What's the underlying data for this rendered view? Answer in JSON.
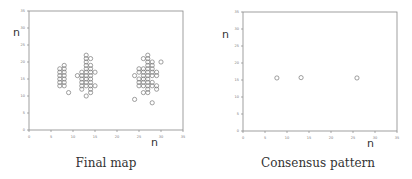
{
  "chart_data": [
    {
      "type": "scatter",
      "title": "Final map",
      "xlabel": "n",
      "ylabel": "n",
      "xlim": [
        0,
        35
      ],
      "ylim": [
        0,
        35
      ],
      "xticks": [
        0,
        5,
        10,
        15,
        20,
        25,
        30,
        35
      ],
      "yticks": [
        0,
        5,
        10,
        15,
        20,
        25,
        30,
        35
      ],
      "grid": false,
      "marker": "open-circle",
      "points": [
        [
          7,
          13
        ],
        [
          7,
          14
        ],
        [
          7,
          15
        ],
        [
          7,
          16
        ],
        [
          7,
          17
        ],
        [
          7,
          18
        ],
        [
          8,
          13
        ],
        [
          8,
          14
        ],
        [
          8,
          15
        ],
        [
          8,
          16
        ],
        [
          8,
          17
        ],
        [
          8,
          18
        ],
        [
          8,
          19
        ],
        [
          9,
          11
        ],
        [
          11,
          16
        ],
        [
          12,
          12
        ],
        [
          12,
          13
        ],
        [
          12,
          14
        ],
        [
          12,
          15
        ],
        [
          12,
          16
        ],
        [
          12,
          17
        ],
        [
          13,
          10
        ],
        [
          13,
          13
        ],
        [
          13,
          14
        ],
        [
          13,
          15
        ],
        [
          13,
          16
        ],
        [
          13,
          17
        ],
        [
          13,
          18
        ],
        [
          13,
          19
        ],
        [
          13,
          20
        ],
        [
          13,
          21
        ],
        [
          13,
          22
        ],
        [
          14,
          11
        ],
        [
          14,
          12
        ],
        [
          14,
          13
        ],
        [
          14,
          14
        ],
        [
          14,
          15
        ],
        [
          14,
          16
        ],
        [
          14,
          17
        ],
        [
          14,
          18
        ],
        [
          14,
          19
        ],
        [
          14,
          21
        ],
        [
          15,
          13
        ],
        [
          15,
          17
        ],
        [
          24,
          9
        ],
        [
          24,
          16
        ],
        [
          25,
          13
        ],
        [
          25,
          14
        ],
        [
          25,
          15
        ],
        [
          25,
          17
        ],
        [
          25,
          18
        ],
        [
          26,
          11
        ],
        [
          26,
          13
        ],
        [
          26,
          14
        ],
        [
          26,
          15
        ],
        [
          26,
          16
        ],
        [
          26,
          17
        ],
        [
          26,
          18
        ],
        [
          26,
          21
        ],
        [
          27,
          11
        ],
        [
          27,
          12
        ],
        [
          27,
          13
        ],
        [
          27,
          14
        ],
        [
          27,
          15
        ],
        [
          27,
          16
        ],
        [
          27,
          17
        ],
        [
          27,
          18
        ],
        [
          27,
          19
        ],
        [
          27,
          20
        ],
        [
          27,
          21
        ],
        [
          27,
          22
        ],
        [
          28,
          8
        ],
        [
          28,
          13
        ],
        [
          28,
          14
        ],
        [
          28,
          16
        ],
        [
          28,
          17
        ],
        [
          28,
          18
        ],
        [
          28,
          19
        ],
        [
          28,
          20
        ],
        [
          29,
          12
        ],
        [
          29,
          13
        ],
        [
          29,
          16
        ],
        [
          29,
          17
        ],
        [
          30,
          20
        ]
      ]
    },
    {
      "type": "scatter",
      "title": "Consensus pattern",
      "xlabel": "n",
      "ylabel": "n",
      "xlim": [
        0,
        35
      ],
      "ylim": [
        0,
        35
      ],
      "xticks": [
        0,
        5,
        10,
        15,
        20,
        25,
        30,
        35
      ],
      "yticks": [
        0,
        5,
        10,
        15,
        20,
        25,
        30,
        35
      ],
      "grid": false,
      "marker": "open-circle",
      "points": [
        [
          7.7,
          15.6
        ],
        [
          13.2,
          15.7
        ],
        [
          25.9,
          15.6
        ]
      ]
    }
  ],
  "panels": [
    {
      "caption": "Final map",
      "ylabel": "n",
      "xlabel": "n"
    },
    {
      "caption": "Consensus pattern",
      "ylabel": "n",
      "xlabel": "n"
    }
  ]
}
